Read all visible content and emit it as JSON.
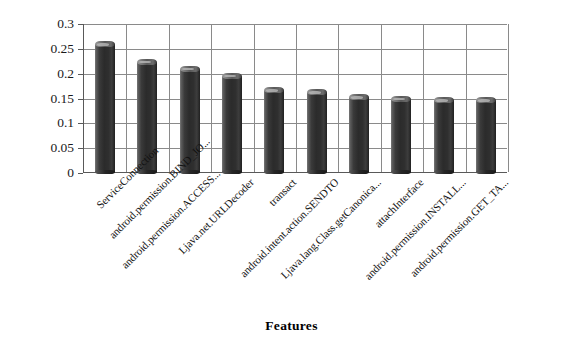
{
  "chart_data": {
    "type": "bar",
    "title": "",
    "xlabel": "Features",
    "ylabel": "Weights",
    "ylim": [
      0,
      0.3
    ],
    "yticks": [
      "0",
      "0.05",
      "0.1",
      "0.15",
      "0.2",
      "0.25",
      "0.3"
    ],
    "ytick_values": [
      0,
      0.05,
      0.1,
      0.15,
      0.2,
      0.25,
      0.3
    ],
    "grid": "both",
    "legend": "none",
    "bar_color": "#2b2b2b",
    "categories": [
      "ServiceConnection",
      "android.permission.BIND_JO...",
      "android.permission.ACCESS...",
      "Ljava.net.URLDecoder",
      "transact",
      "android.intent.action.SENDTO",
      "Ljava.lang.Class.getCanonica...",
      "attachInterface",
      "android.permission.INSTALL...",
      "android.permission.GET_TA..."
    ],
    "values": [
      0.257,
      0.222,
      0.208,
      0.194,
      0.165,
      0.161,
      0.151,
      0.148,
      0.145,
      0.145
    ]
  }
}
